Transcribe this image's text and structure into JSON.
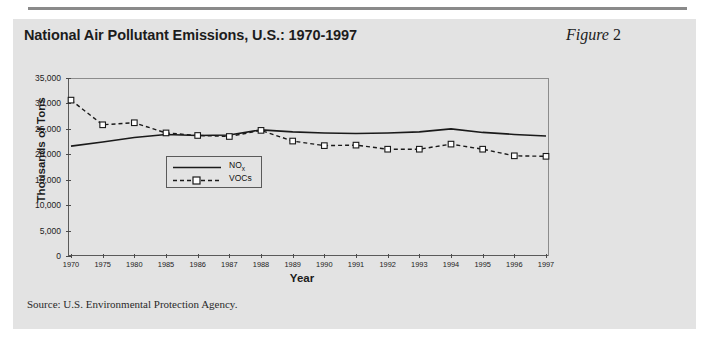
{
  "figure": {
    "title": "National Air Pollutant Emissions, U.S.: 1970-1997",
    "number_prefix": "Figure",
    "number": "2",
    "source": "Source: U.S. Environmental Protection Agency."
  },
  "colors": {
    "panel_background": "#e3e3e3",
    "page_background": "#ffffff",
    "rule": "#8a8a8a",
    "axis": "#5a5a5a",
    "series_line": "#1a1a1a",
    "marker_fill": "#ffffff",
    "text": "#1c1c1c"
  },
  "legend": {
    "position": "inside-plot-left",
    "entries": [
      {
        "label": "NO",
        "sub": "x",
        "style": "solid",
        "marker": "none"
      },
      {
        "label": "VOCs",
        "sub": "",
        "style": "dashed",
        "marker": "square"
      }
    ]
  },
  "chart_data": {
    "type": "line",
    "title": "National Air Pollutant Emissions, U.S.: 1970-1997",
    "xlabel": "Year",
    "ylabel": "Thousands of Tons",
    "categories": [
      "1970",
      "1975",
      "1980",
      "1985",
      "1986",
      "1987",
      "1988",
      "1989",
      "1990",
      "1991",
      "1992",
      "1993",
      "1994",
      "1995",
      "1996",
      "1997"
    ],
    "ytick_labels": [
      "0",
      "5,000",
      "10,000",
      "15,000",
      "20,000",
      "25,000",
      "30,000",
      "35,000"
    ],
    "ytick_values": [
      0,
      5000,
      10000,
      15000,
      20000,
      25000,
      30000,
      35000
    ],
    "ylim": [
      0,
      35000
    ],
    "grid": false,
    "series": [
      {
        "name": "NOx",
        "style": "solid",
        "marker": "none",
        "values": [
          21600,
          22400,
          23300,
          23900,
          23700,
          23800,
          24800,
          24400,
          24200,
          24100,
          24200,
          24400,
          25000,
          24300,
          23900,
          23600
        ]
      },
      {
        "name": "VOCs",
        "style": "dashed",
        "marker": "square",
        "values": [
          30650,
          25800,
          26200,
          24200,
          23700,
          23500,
          24700,
          22600,
          21700,
          21800,
          21000,
          21000,
          22000,
          21000,
          19700,
          19600
        ]
      }
    ]
  }
}
